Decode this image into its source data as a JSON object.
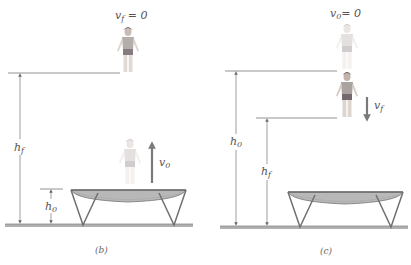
{
  "panels": [
    {
      "id": "b",
      "caption": "(b)",
      "top_label": {
        "var": "v",
        "sub": "f",
        "eq": " = 0"
      },
      "arrow_label": {
        "var": "v",
        "sub": "0"
      },
      "height_labels": [
        {
          "var": "h",
          "sub": "f"
        },
        {
          "var": "h",
          "sub": "0"
        }
      ],
      "arrow_direction": "up"
    },
    {
      "id": "c",
      "caption": "(c)",
      "top_label": {
        "var": "v",
        "sub": "0",
        "eq": "= 0"
      },
      "arrow_label": {
        "var": "v",
        "sub": "f"
      },
      "height_labels": [
        {
          "var": "h",
          "sub": "0"
        },
        {
          "var": "h",
          "sub": "f"
        }
      ],
      "arrow_direction": "down"
    }
  ],
  "colors": {
    "line": "#777777",
    "arrow": "#7a7a7a",
    "ground": "#9a9a9a",
    "trampoline_frame": "#707070",
    "trampoline_bed": "#8a8a8a",
    "person_skin": "#cfc3b8",
    "person_shirt": "#9c9490",
    "person_shorts": "#5e4f55"
  }
}
